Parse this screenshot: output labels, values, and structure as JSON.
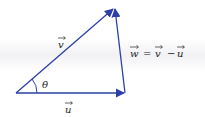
{
  "diagram": {
    "type": "vector-triangle",
    "colors": {
      "vector": "#2b3fa6",
      "text": "#222222",
      "background": "#ffffff"
    },
    "vectors": [
      {
        "id": "u",
        "label": "u",
        "from": "O",
        "to": "A"
      },
      {
        "id": "v",
        "label": "v",
        "from": "O",
        "to": "B"
      },
      {
        "id": "w",
        "label": "w",
        "from": "A",
        "to": "B"
      }
    ],
    "labels": {
      "v": "v",
      "u": "u",
      "w_lhs": "w",
      "equals": "=",
      "v_rhs": "v",
      "minus": "−",
      "u_rhs": "u",
      "angle": "θ"
    },
    "equation": "w = v − u"
  }
}
